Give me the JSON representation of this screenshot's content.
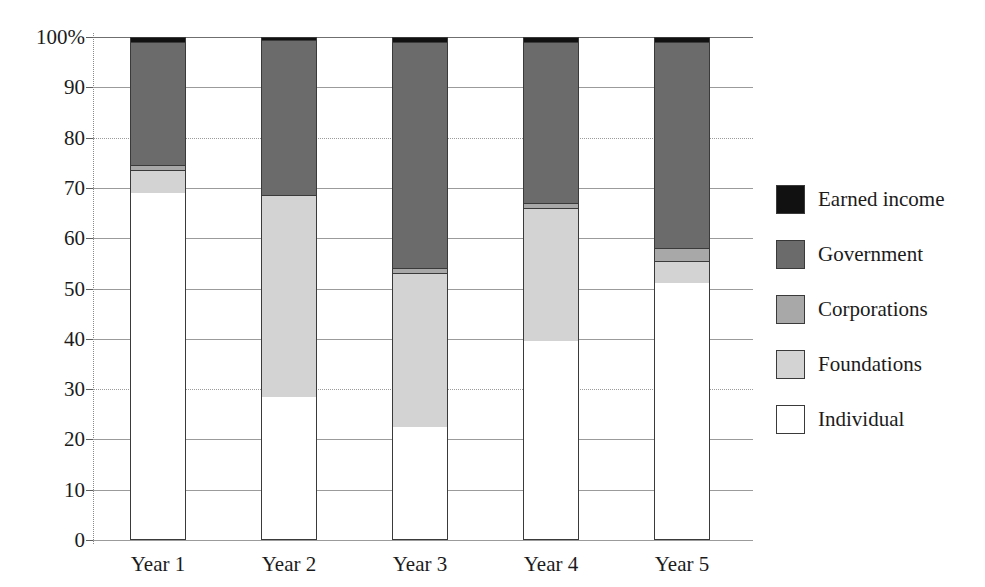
{
  "chart_data": {
    "type": "bar",
    "subtype": "stacked-percentage-column",
    "title": "",
    "xlabel": "",
    "ylabel": "",
    "ylim": [
      0,
      100
    ],
    "yticks": [
      0,
      10,
      20,
      30,
      40,
      50,
      60,
      70,
      80,
      90,
      100
    ],
    "ytick_labels": [
      "0",
      "10",
      "20",
      "30",
      "40",
      "50",
      "60",
      "70",
      "80",
      "90",
      "100%"
    ],
    "grid": true,
    "legend_position": "right",
    "categories": [
      "Year 1",
      "Year 2",
      "Year 3",
      "Year 4",
      "Year 5"
    ],
    "series": [
      {
        "name": "Individual",
        "color": "#ffffff",
        "values": [
          69.0,
          28.5,
          22.5,
          39.5,
          51.0
        ]
      },
      {
        "name": "Foundations",
        "color": "#d3d3d3",
        "values": [
          4.5,
          40.0,
          30.5,
          26.5,
          4.5
        ]
      },
      {
        "name": "Corporations",
        "color": "#a8a8a8",
        "values": [
          1.0,
          0.0,
          1.0,
          1.0,
          2.5
        ]
      },
      {
        "name": "Government",
        "color": "#6b6b6b",
        "values": [
          24.5,
          31.0,
          45.0,
          32.0,
          41.0
        ]
      },
      {
        "name": "Earned income",
        "color": "#111111",
        "values": [
          1.0,
          0.5,
          1.0,
          1.0,
          1.0
        ]
      }
    ],
    "cumulative_tops": {
      "Year 1": {
        "Individual": 69.0,
        "Foundations": 73.5,
        "Corporations": 74.5,
        "Government": 99.0,
        "Earned income": 100.0
      },
      "Year 2": {
        "Individual": 28.5,
        "Foundations": 68.5,
        "Corporations": 68.5,
        "Government": 99.5,
        "Earned income": 100.0
      },
      "Year 3": {
        "Individual": 22.5,
        "Foundations": 53.0,
        "Corporations": 54.0,
        "Government": 99.0,
        "Earned income": 100.0
      },
      "Year 4": {
        "Individual": 39.5,
        "Foundations": 66.0,
        "Corporations": 67.0,
        "Government": 99.0,
        "Earned income": 100.0
      },
      "Year 5": {
        "Individual": 51.0,
        "Foundations": 55.5,
        "Corporations": 58.0,
        "Government": 99.0,
        "Earned income": 100.0
      }
    }
  },
  "legend": {
    "items": [
      {
        "label": "Earned income",
        "color": "#111111"
      },
      {
        "label": "Government",
        "color": "#6b6b6b"
      },
      {
        "label": "Corporations",
        "color": "#a8a8a8"
      },
      {
        "label": "Foundations",
        "color": "#d3d3d3"
      },
      {
        "label": "Individual",
        "color": "#ffffff"
      }
    ]
  }
}
